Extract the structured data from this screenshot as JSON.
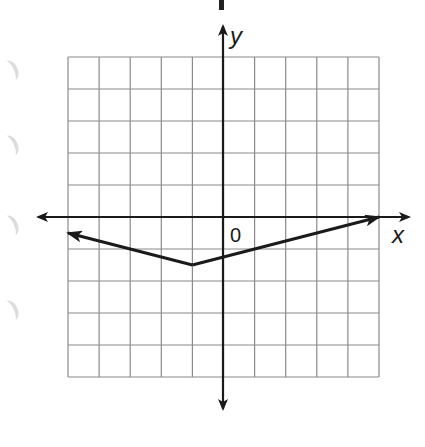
{
  "diagram": {
    "type": "coordinate-plane-graph",
    "axis_labels": {
      "x": "x",
      "y": "y",
      "origin": "0"
    },
    "grid": {
      "x_min": -5,
      "x_max": 5,
      "y_min": -5,
      "y_max": 5,
      "step": 1,
      "rows": 10,
      "cols": 10
    },
    "function": {
      "kind": "absolute-value",
      "vertex": [
        -1,
        -1.5
      ],
      "left_arrow_end": [
        -5,
        -0.5
      ],
      "right_arrow_end": [
        5,
        0
      ],
      "opens": "up"
    },
    "colors": {
      "grid": "#8a8a8a",
      "axes": "#1a1a1a",
      "graph": "#1a1a1a",
      "background": "#ffffff"
    }
  }
}
